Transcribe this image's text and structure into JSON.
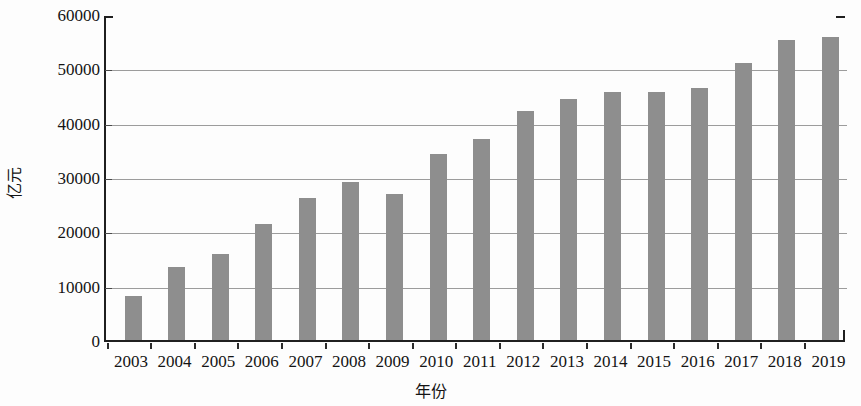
{
  "chart_data": {
    "type": "bar",
    "title": "",
    "xlabel": "年份",
    "ylabel": "亿元",
    "categories": [
      "2003",
      "2004",
      "2005",
      "2006",
      "2007",
      "2008",
      "2009",
      "2010",
      "2011",
      "2012",
      "2013",
      "2014",
      "2015",
      "2016",
      "2017",
      "2018",
      "2019"
    ],
    "values": [
      8100,
      13500,
      15800,
      21300,
      26200,
      29000,
      26900,
      34200,
      37000,
      42100,
      44300,
      45600,
      45700,
      46300,
      50900,
      55200,
      55800
    ],
    "ylim": [
      0,
      60000
    ],
    "ytick_values": [
      0,
      10000,
      20000,
      30000,
      40000,
      50000,
      60000
    ],
    "ytick_labels": [
      "0",
      "10000",
      "20000",
      "30000",
      "40000",
      "50000",
      "60000"
    ],
    "grid": true,
    "grid_axis": "y",
    "legend": null,
    "legend_position": "none",
    "bar_color": "#8e8e8e",
    "axis_color": "#1f1f1f",
    "grid_color": "#9c9c9c"
  }
}
